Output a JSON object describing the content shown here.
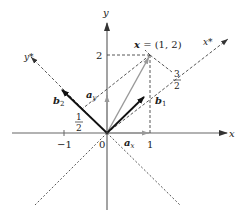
{
  "diagram": {
    "axes": {
      "x_label": "x",
      "y_label": "y",
      "xstar_label": "x*",
      "ystar_label": "y*",
      "origin_label": "0",
      "tick_x_pos": "1",
      "tick_x_neg": "−1",
      "tick_y": "2"
    },
    "point": {
      "label": "x = (1, 2)",
      "name": "x",
      "coords": "(1, 2)"
    },
    "vectors": {
      "b1": "b",
      "b1_sub": "1",
      "b2": "b",
      "b2_sub": "2",
      "ax": "a",
      "ax_sub": "x",
      "ay": "a",
      "ay_sub": "y"
    },
    "fractions": {
      "three_halves_num": "3",
      "three_halves_den": "2",
      "one_half_num": "1",
      "one_half_den": "2"
    },
    "colors": {
      "axis": "#555555",
      "dashed": "#444444",
      "basis": "#111111",
      "gray_vec": "#999999"
    }
  }
}
